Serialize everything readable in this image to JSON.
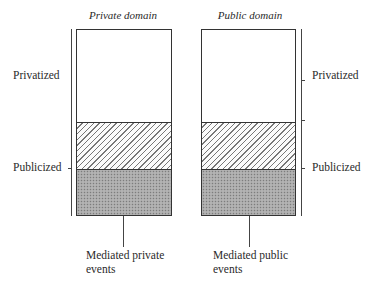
{
  "diagram": {
    "columns": [
      {
        "title": "Private domain",
        "side_label_top": "Privatized",
        "side_label_bottom": "Publicized",
        "caption_line1": "Mediated private",
        "caption_line2": "events"
      },
      {
        "title": "Public domain",
        "side_label_top": "Privatized",
        "side_label_bottom": "Publicized",
        "caption_line1": "Mediated public",
        "caption_line2": "events"
      }
    ],
    "segments": [
      {
        "name": "plain",
        "pattern": "white",
        "top_px": 30,
        "bottom_px": 122
      },
      {
        "name": "hatched",
        "pattern": "diagonal-hatch",
        "top_px": 122,
        "bottom_px": 169
      },
      {
        "name": "stippled",
        "pattern": "gray-dots",
        "top_px": 169,
        "bottom_px": 215
      }
    ],
    "colors": {
      "line": "#333333",
      "hatch": "#777777",
      "stipple": "#a9a9a9"
    }
  }
}
